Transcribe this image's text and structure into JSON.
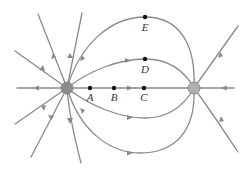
{
  "diagram": {
    "colors": {
      "field_line": "#8a8a8a",
      "charge_left": "#8c8c8c",
      "charge_right": "#b0b0b0",
      "point": "#111111",
      "label": "#333333"
    },
    "charges": [
      {
        "id": "left",
        "sign": "positive",
        "x": 67,
        "y": 88,
        "r": 6
      },
      {
        "id": "right",
        "sign": "negative",
        "x": 194,
        "y": 88,
        "r": 6
      }
    ],
    "points": [
      {
        "label": "A",
        "x": 90,
        "y": 88,
        "lx": 90,
        "ly": 101
      },
      {
        "label": "B",
        "x": 114,
        "y": 88,
        "lx": 114,
        "ly": 101
      },
      {
        "label": "C",
        "x": 144,
        "y": 88,
        "lx": 144,
        "ly": 101
      },
      {
        "label": "D",
        "x": 145,
        "y": 59,
        "lx": 145,
        "ly": 73
      },
      {
        "label": "E",
        "x": 145,
        "y": 17,
        "lx": 145,
        "ly": 31
      }
    ],
    "labels": {
      "A": "A",
      "B": "B",
      "C": "C",
      "D": "D",
      "E": "E"
    }
  }
}
